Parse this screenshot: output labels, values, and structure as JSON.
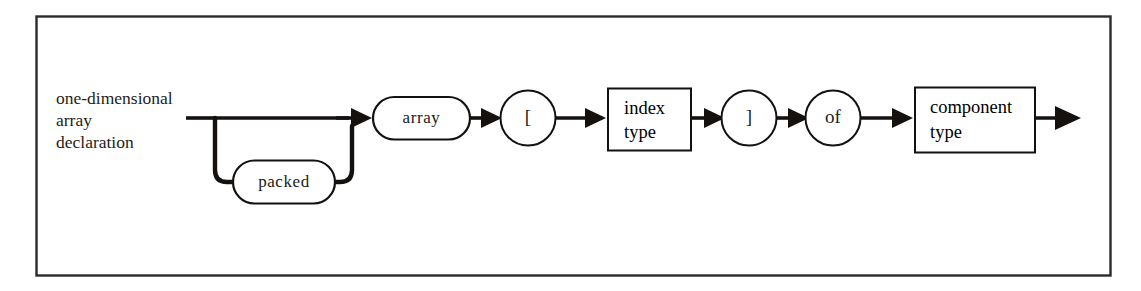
{
  "figure": {
    "kind": "syntax-railroad-diagram",
    "title": "one-dimensional array declaration",
    "background_color": "#ffffff",
    "ink_color": "#14110f",
    "frame_color": "#2b2b2b"
  },
  "rule_label": {
    "name": "one-dimensional-array-declaration",
    "lines": [
      "one-dimensional",
      "array",
      "declaration"
    ]
  },
  "nodes": {
    "packed": {
      "label": "packed",
      "shape": "stadium",
      "kind": "terminal",
      "optional": true
    },
    "array": {
      "label": "array",
      "shape": "stadium",
      "kind": "terminal"
    },
    "open_bracket": {
      "label": "[",
      "shape": "circle",
      "kind": "terminal"
    },
    "index_type": {
      "label_lines": [
        "index",
        "type"
      ],
      "shape": "rectangle",
      "kind": "nonterminal"
    },
    "close_bracket": {
      "label": "]",
      "shape": "circle",
      "kind": "terminal"
    },
    "of": {
      "label": "of",
      "shape": "circle",
      "kind": "terminal"
    },
    "component_type": {
      "label_lines": [
        "component",
        "type"
      ],
      "shape": "rectangle",
      "kind": "nonterminal"
    }
  },
  "sequence": [
    "packed",
    "array",
    "open_bracket",
    "index_type",
    "close_bracket",
    "of",
    "component_type"
  ]
}
